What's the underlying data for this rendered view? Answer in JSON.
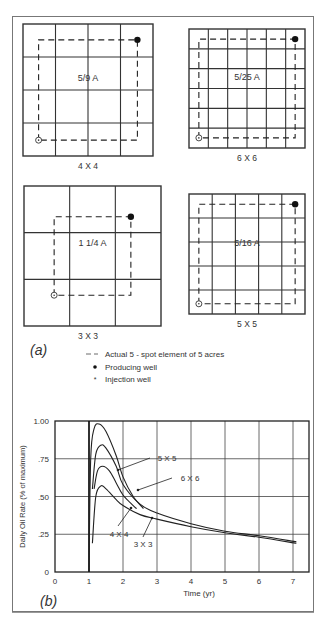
{
  "figure": {
    "panel_a": {
      "label": "(a)",
      "patterns": [
        {
          "id": "4x4",
          "grid": 4,
          "area_label": "5/9 A",
          "caption": "4 X 4"
        },
        {
          "id": "6x6",
          "grid": 6,
          "area_label": "5/25 A",
          "caption": "6 X 6"
        },
        {
          "id": "3x3",
          "grid": 3,
          "area_label": "1 1/4 A",
          "caption": "3 X 3"
        },
        {
          "id": "5x5",
          "grid": 5,
          "area_label": "5/16 A",
          "caption": "5 X 5"
        }
      ],
      "legend": [
        {
          "symbol": "dashed-line",
          "text": "Actual 5 - spot element of 5 acres"
        },
        {
          "symbol": "filled-dot",
          "text": "Producing well"
        },
        {
          "symbol": "circle-dot",
          "text": "Injection well"
        }
      ]
    },
    "panel_b": {
      "label": "(b)"
    }
  },
  "chart_data": {
    "type": "line",
    "title": "",
    "xlabel": "Time (yr)",
    "ylabel": "Daily Oil Rate (% of maximum)",
    "xlim": [
      0,
      7.2
    ],
    "ylim": [
      0,
      1.0
    ],
    "x_ticks": [
      "0",
      "1",
      "2",
      "3",
      "4",
      "5",
      "6",
      "7"
    ],
    "y_ticks": [
      "0",
      ".25",
      ".50",
      ".75",
      "1.00"
    ],
    "grid": true,
    "series": [
      {
        "name": "5 X 5",
        "x": [
          1.0,
          1.05,
          1.15,
          1.3,
          1.5,
          1.8,
          2.0,
          2.3,
          2.6
        ],
        "values": [
          0.0,
          0.75,
          0.95,
          0.98,
          0.93,
          0.77,
          0.63,
          0.5,
          0.42
        ]
      },
      {
        "name": "6 X 6",
        "x": [
          1.1,
          1.2,
          1.35,
          1.5,
          1.8,
          2.0,
          2.5,
          3.0,
          4.0,
          5.0,
          6.0,
          7.1
        ],
        "values": [
          0.55,
          0.78,
          0.84,
          0.82,
          0.7,
          0.58,
          0.45,
          0.39,
          0.32,
          0.27,
          0.24,
          0.2
        ]
      },
      {
        "name": "4 X 4",
        "x": [
          1.15,
          1.25,
          1.4,
          1.6,
          1.8,
          2.0,
          2.3,
          2.4
        ],
        "values": [
          0.55,
          0.67,
          0.7,
          0.67,
          0.59,
          0.51,
          0.44,
          0.42
        ]
      },
      {
        "name": "3 X 3",
        "x": [
          1.1,
          1.2,
          1.35,
          1.5,
          1.8,
          2.0,
          2.5,
          3.0,
          4.0,
          5.0,
          6.0,
          7.1
        ],
        "values": [
          0.19,
          0.5,
          0.57,
          0.55,
          0.48,
          0.44,
          0.38,
          0.35,
          0.3,
          0.26,
          0.23,
          0.19
        ]
      }
    ],
    "annotations": [
      "5 X 5",
      "6 X 6",
      "4 X 4",
      "3 X 3"
    ]
  }
}
